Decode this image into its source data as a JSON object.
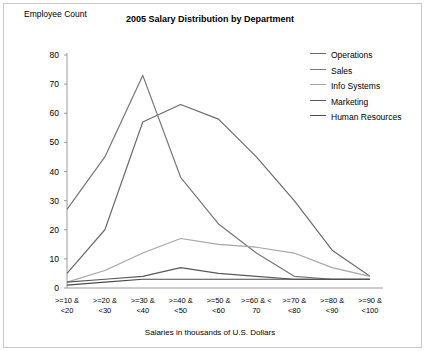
{
  "chart_data": {
    "type": "line",
    "title": "2005 Salary Distribution by Department",
    "xlabel": "Salaries in thousands of U.S. Dollars",
    "ylabel": "Employee Count",
    "ylim": [
      0,
      80
    ],
    "ytick_step": 10,
    "yticks": [
      80,
      70,
      60,
      50,
      40,
      30,
      20,
      10,
      0
    ],
    "grid": false,
    "legend_position": "top-right",
    "categories": [
      ">=10 & <20",
      ">=20 & <30",
      ">=30 & <40",
      ">=40 & <50",
      ">=50 & <60",
      ">=60 & < 70",
      ">=70 & <80",
      ">=80 & <90",
      ">=90 & <100"
    ],
    "category_lines": [
      [
        ">=10 &",
        "<20"
      ],
      [
        ">=20 &",
        "<30"
      ],
      [
        ">=30 &",
        "<40"
      ],
      [
        ">=40 &",
        "<50"
      ],
      [
        ">=50 &",
        "<60"
      ],
      [
        ">=60 & <",
        "70"
      ],
      [
        ">=70 &",
        "<80"
      ],
      [
        ">=80 &",
        "<90"
      ],
      [
        ">=90 &",
        "<100"
      ]
    ],
    "series": [
      {
        "name": "Operations",
        "color": "#6b6b6b",
        "values": [
          5,
          20,
          57,
          63,
          58,
          45,
          30,
          13,
          4
        ]
      },
      {
        "name": "Sales",
        "color": "#767676",
        "values": [
          27,
          45,
          73,
          38,
          22,
          12,
          4,
          3,
          3
        ]
      },
      {
        "name": "Info Systems",
        "color": "#a6a6a6",
        "values": [
          2,
          6,
          12,
          17,
          15,
          14,
          12,
          7,
          4
        ]
      },
      {
        "name": "Marketing",
        "color": "#595959",
        "values": [
          2,
          3,
          4,
          7,
          5,
          4,
          3,
          3,
          3
        ]
      },
      {
        "name": "Human Resources",
        "color": "#4a4a4a",
        "values": [
          1,
          2,
          3,
          3,
          3,
          3,
          3,
          3,
          3
        ]
      }
    ]
  },
  "legend": {
    "items": [
      {
        "label": "Operations"
      },
      {
        "label": "Sales"
      },
      {
        "label": "Info Systems"
      },
      {
        "label": "Marketing"
      },
      {
        "label": "Human Resources"
      }
    ]
  }
}
